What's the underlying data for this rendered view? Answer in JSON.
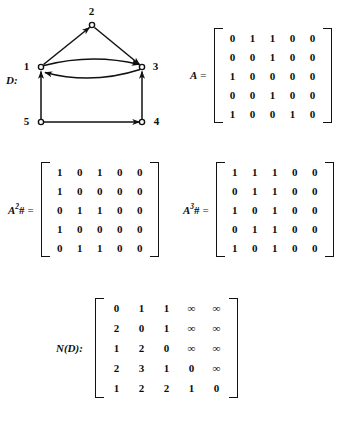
{
  "figure": {
    "digraph": {
      "label": "D:",
      "nodes": [
        {
          "id": "1",
          "label": "1",
          "x": 41,
          "y": 67,
          "label_x": 26,
          "label_y": 61
        },
        {
          "id": "2",
          "label": "2",
          "x": 92,
          "y": 25,
          "label_x": 88,
          "label_y": 6
        },
        {
          "id": "3",
          "label": "3",
          "x": 142,
          "y": 67,
          "label_x": 152,
          "label_y": 61
        },
        {
          "id": "4",
          "label": "4",
          "x": 142,
          "y": 122,
          "label_x": 153,
          "label_y": 116
        },
        {
          "id": "5",
          "label": "5",
          "x": 41,
          "y": 122,
          "label_x": 26,
          "label_y": 116
        }
      ],
      "edges": [
        {
          "from": "1",
          "to": "2",
          "style": "straight"
        },
        {
          "from": "2",
          "to": "3",
          "style": "straight"
        },
        {
          "from": "1",
          "to": "3",
          "style": "curve-up"
        },
        {
          "from": "3",
          "to": "1",
          "style": "curve-down"
        },
        {
          "from": "5",
          "to": "1",
          "style": "straight"
        },
        {
          "from": "5",
          "to": "4",
          "style": "straight"
        },
        {
          "from": "4",
          "to": "3",
          "style": "straight"
        }
      ]
    },
    "matrices": [
      {
        "name": "A",
        "label_html": "A",
        "equals": "=",
        "rows": [
          [
            "0",
            "1",
            "1",
            "0",
            "0"
          ],
          [
            "0",
            "0",
            "1",
            "0",
            "0"
          ],
          [
            "1",
            "0",
            "0",
            "0",
            "0"
          ],
          [
            "0",
            "0",
            "1",
            "0",
            "0"
          ],
          [
            "1",
            "0",
            "0",
            "1",
            "0"
          ]
        ]
      },
      {
        "name": "A2sharp",
        "label_html": "A2#",
        "equals": "=",
        "rows": [
          [
            "1",
            "0",
            "1",
            "0",
            "0"
          ],
          [
            "1",
            "0",
            "0",
            "0",
            "0"
          ],
          [
            "0",
            "1",
            "1",
            "0",
            "0"
          ],
          [
            "1",
            "0",
            "0",
            "0",
            "0"
          ],
          [
            "0",
            "1",
            "1",
            "0",
            "0"
          ]
        ]
      },
      {
        "name": "A3sharp",
        "label_html": "A3#",
        "equals": "=",
        "rows": [
          [
            "1",
            "1",
            "1",
            "0",
            "0"
          ],
          [
            "0",
            "1",
            "1",
            "0",
            "0"
          ],
          [
            "1",
            "0",
            "1",
            "0",
            "0"
          ],
          [
            "0",
            "1",
            "1",
            "0",
            "0"
          ],
          [
            "1",
            "0",
            "1",
            "0",
            "0"
          ]
        ]
      },
      {
        "name": "ND",
        "label_html": "N(D):",
        "equals": "",
        "rows": [
          [
            "0",
            "1",
            "1",
            "∞",
            "∞"
          ],
          [
            "2",
            "0",
            "1",
            "∞",
            "∞"
          ],
          [
            "1",
            "2",
            "0",
            "∞",
            "∞"
          ],
          [
            "2",
            "3",
            "1",
            "0",
            "∞"
          ],
          [
            "1",
            "2",
            "2",
            "1",
            "0"
          ]
        ]
      }
    ]
  }
}
